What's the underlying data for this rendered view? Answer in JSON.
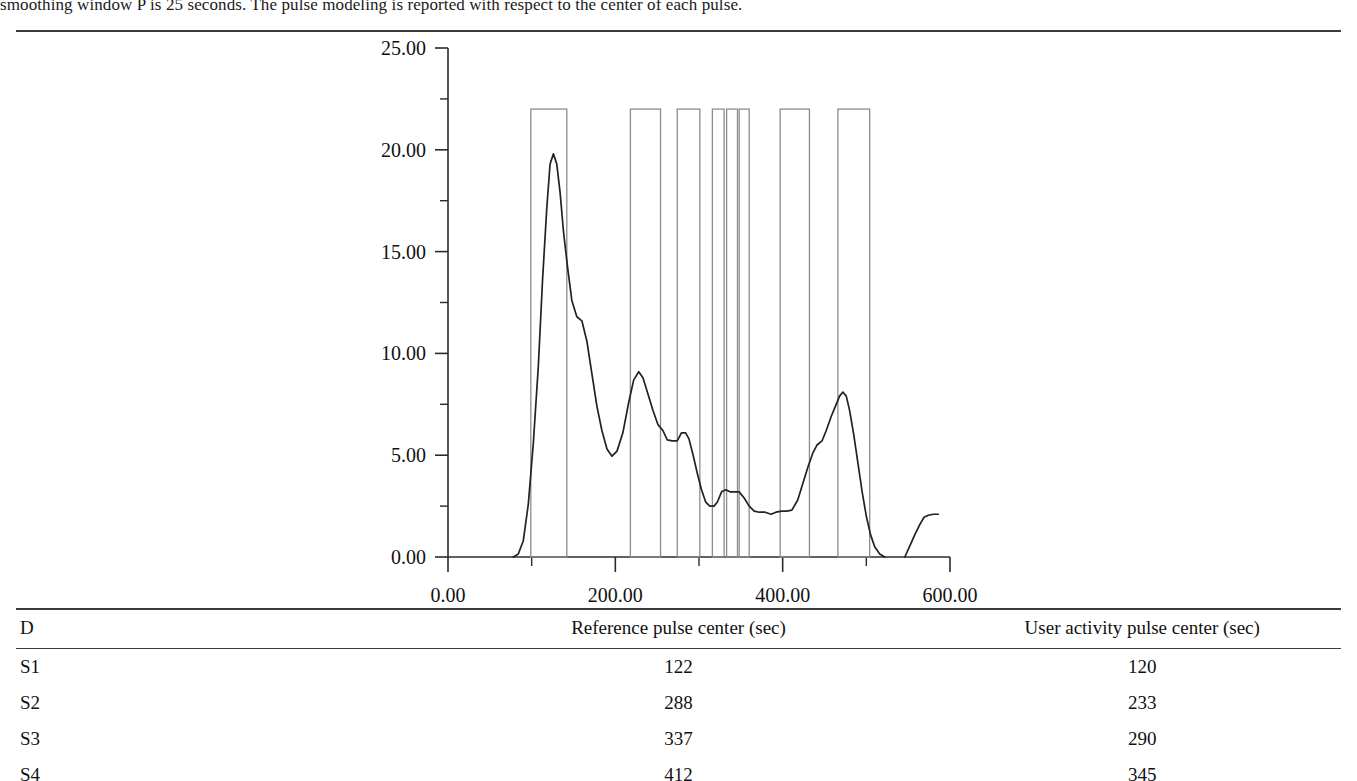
{
  "document": {
    "paragraph_text": "smoothing window P is 25 seconds. The pulse modeling is reported with respect to the center of each pulse."
  },
  "chart_data": {
    "type": "line",
    "title": "",
    "xlabel": "",
    "ylabel": "",
    "xlim": [
      0,
      600
    ],
    "ylim": [
      0,
      25
    ],
    "x_ticks": [
      "0.00",
      "200.00",
      "400.00",
      "600.00"
    ],
    "x_tick_values": [
      0,
      200,
      400,
      600
    ],
    "x_minor_tick_values": [
      100,
      300,
      500
    ],
    "y_ticks": [
      "0.00",
      "5.00",
      "10.00",
      "15.00",
      "20.00",
      "25.00"
    ],
    "y_tick_values": [
      0,
      5,
      10,
      15,
      20,
      25
    ],
    "y_minor_tick_values": [
      2.5,
      7.5,
      12.5,
      17.5,
      22.5
    ],
    "grid": false,
    "legend": null,
    "series": [
      {
        "name": "user activity density",
        "type": "line",
        "color": "#222222",
        "points": [
          [
            78,
            0.0
          ],
          [
            84,
            0.15
          ],
          [
            90,
            0.8
          ],
          [
            96,
            2.6
          ],
          [
            102,
            5.6
          ],
          [
            108,
            9.4
          ],
          [
            113,
            13.6
          ],
          [
            118,
            17.1
          ],
          [
            122,
            19.3
          ],
          [
            126,
            19.8
          ],
          [
            130,
            19.3
          ],
          [
            134,
            17.9
          ],
          [
            138,
            16.0
          ],
          [
            143,
            14.2
          ],
          [
            148,
            12.6
          ],
          [
            154,
            11.8
          ],
          [
            160,
            11.6
          ],
          [
            166,
            10.6
          ],
          [
            172,
            9.0
          ],
          [
            178,
            7.4
          ],
          [
            184,
            6.2
          ],
          [
            190,
            5.3
          ],
          [
            196,
            4.95
          ],
          [
            202,
            5.2
          ],
          [
            209,
            6.1
          ],
          [
            216,
            7.6
          ],
          [
            222,
            8.7
          ],
          [
            228,
            9.1
          ],
          [
            233,
            8.8
          ],
          [
            239,
            8.0
          ],
          [
            245,
            7.2
          ],
          [
            251,
            6.5
          ],
          [
            257,
            6.2
          ],
          [
            262,
            5.75
          ],
          [
            268,
            5.7
          ],
          [
            274,
            5.7
          ],
          [
            279,
            6.1
          ],
          [
            284,
            6.1
          ],
          [
            288,
            5.8
          ],
          [
            293,
            5.0
          ],
          [
            298,
            4.1
          ],
          [
            303,
            3.3
          ],
          [
            308,
            2.7
          ],
          [
            313,
            2.5
          ],
          [
            318,
            2.5
          ],
          [
            322,
            2.7
          ],
          [
            327,
            3.2
          ],
          [
            332,
            3.3
          ],
          [
            337,
            3.2
          ],
          [
            342,
            3.2
          ],
          [
            348,
            3.2
          ],
          [
            354,
            2.9
          ],
          [
            360,
            2.5
          ],
          [
            366,
            2.25
          ],
          [
            372,
            2.2
          ],
          [
            379,
            2.2
          ],
          [
            386,
            2.1
          ],
          [
            392,
            2.2
          ],
          [
            399,
            2.25
          ],
          [
            405,
            2.25
          ],
          [
            411,
            2.3
          ],
          [
            418,
            2.8
          ],
          [
            424,
            3.6
          ],
          [
            430,
            4.4
          ],
          [
            436,
            5.1
          ],
          [
            441,
            5.5
          ],
          [
            447,
            5.7
          ],
          [
            452,
            6.2
          ],
          [
            458,
            6.9
          ],
          [
            463,
            7.4
          ],
          [
            468,
            7.9
          ],
          [
            472,
            8.1
          ],
          [
            476,
            7.9
          ],
          [
            480,
            7.2
          ],
          [
            485,
            6.0
          ],
          [
            490,
            4.6
          ],
          [
            495,
            3.2
          ],
          [
            500,
            2.0
          ],
          [
            505,
            1.1
          ],
          [
            510,
            0.5
          ],
          [
            516,
            0.15
          ],
          [
            522,
            0.0
          ],
          [
            546,
            0.0
          ],
          [
            552,
            0.55
          ],
          [
            558,
            1.1
          ],
          [
            564,
            1.6
          ],
          [
            569,
            1.95
          ],
          [
            574,
            2.05
          ],
          [
            580,
            2.1
          ],
          [
            586,
            2.1
          ]
        ]
      },
      {
        "name": "reference pulses",
        "type": "pulse-boxes",
        "color": "#8c8c8c",
        "amplitude": 22.0,
        "boxes": [
          {
            "start": 99,
            "end": 142
          },
          {
            "start": 218,
            "end": 254
          },
          {
            "start": 274,
            "end": 301
          },
          {
            "start": 316,
            "end": 330
          },
          {
            "start": 333,
            "end": 346
          },
          {
            "start": 348,
            "end": 360
          },
          {
            "start": 397,
            "end": 432
          },
          {
            "start": 466,
            "end": 504
          }
        ]
      }
    ]
  },
  "table": {
    "columns": [
      "D",
      "Reference pulse center (sec)",
      "User activity pulse center (sec)"
    ],
    "rows": [
      {
        "id": "S1",
        "reference": "122",
        "user": "120"
      },
      {
        "id": "S2",
        "reference": "288",
        "user": "233"
      },
      {
        "id": "S3",
        "reference": "337",
        "user": "290"
      },
      {
        "id": "S4",
        "reference": "412",
        "user": "345"
      }
    ]
  }
}
